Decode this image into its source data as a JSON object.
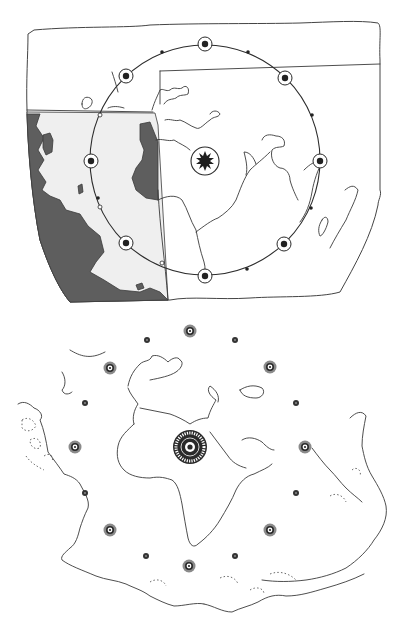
{
  "figure": {
    "colors": {
      "background": "#ffffff",
      "line": "#3a3a3a",
      "shade_dark": "#5e5e5e",
      "shade_light": "#efefef",
      "ring_gray": "#8a8a8a",
      "marker_dark": "#222222"
    }
  },
  "top_map": {
    "center_symbol": {
      "icon": "sun-burst-icon",
      "x": 205,
      "y": 161,
      "r": 14
    },
    "orbit": {
      "cx": 205,
      "cy": 160,
      "r": 115
    },
    "large_markers": [
      {
        "x": 205,
        "y": 44
      },
      {
        "x": 285,
        "y": 78
      },
      {
        "x": 320,
        "y": 161
      },
      {
        "x": 284,
        "y": 244
      },
      {
        "x": 205,
        "y": 276
      },
      {
        "x": 126,
        "y": 243
      },
      {
        "x": 91,
        "y": 161
      },
      {
        "x": 126,
        "y": 76
      }
    ],
    "small_dark_dots": [
      {
        "x": 162,
        "y": 52
      },
      {
        "x": 248,
        "y": 52
      },
      {
        "x": 312,
        "y": 115
      },
      {
        "x": 311,
        "y": 208
      },
      {
        "x": 247,
        "y": 269
      },
      {
        "x": 98,
        "y": 198
      }
    ],
    "small_white_dots": [
      {
        "x": 100,
        "y": 115
      },
      {
        "x": 100,
        "y": 207
      },
      {
        "x": 162,
        "y": 263
      }
    ]
  },
  "bottom_map": {
    "center_symbol": {
      "icon": "wheel-icon",
      "x": 190,
      "y": 447,
      "r": 17
    },
    "large_rings": [
      {
        "x": 190,
        "y": 331
      },
      {
        "x": 270,
        "y": 367
      },
      {
        "x": 305,
        "y": 447
      },
      {
        "x": 270,
        "y": 530
      },
      {
        "x": 189,
        "y": 566
      },
      {
        "x": 110,
        "y": 530
      },
      {
        "x": 75,
        "y": 447
      },
      {
        "x": 110,
        "y": 368
      }
    ],
    "small_dots": [
      {
        "x": 147,
        "y": 340
      },
      {
        "x": 235,
        "y": 340
      },
      {
        "x": 296,
        "y": 403
      },
      {
        "x": 296,
        "y": 493
      },
      {
        "x": 235,
        "y": 556
      },
      {
        "x": 146,
        "y": 556
      },
      {
        "x": 85,
        "y": 493
      },
      {
        "x": 85,
        "y": 403
      }
    ]
  }
}
